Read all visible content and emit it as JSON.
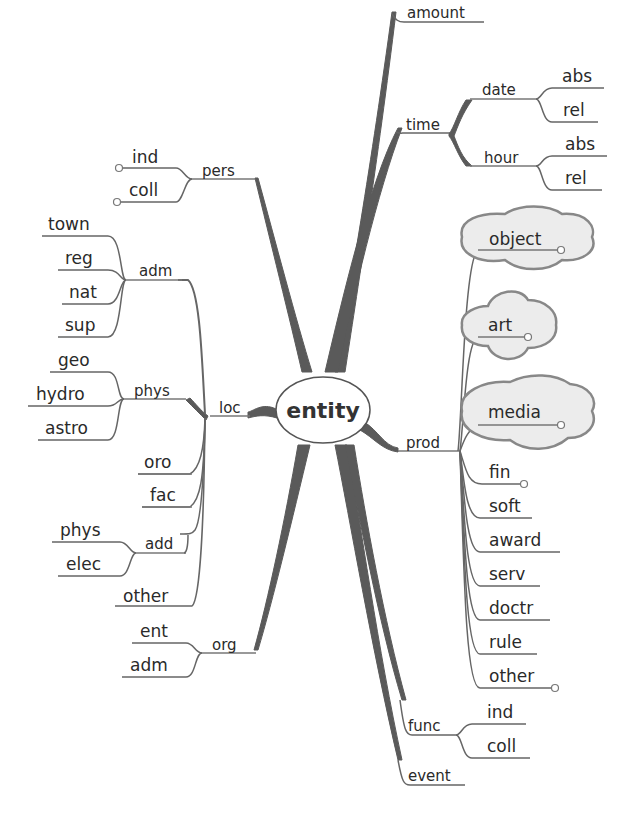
{
  "diagram": {
    "type": "mind-map",
    "root": "entity",
    "left": {
      "pers": {
        "label": "pers",
        "children": [
          "ind",
          "coll"
        ]
      },
      "loc": {
        "label": "loc",
        "adm": {
          "label": "adm",
          "children": [
            "town",
            "reg",
            "nat",
            "sup"
          ]
        },
        "phys": {
          "label": "phys",
          "children": [
            "geo",
            "hydro",
            "astro"
          ]
        },
        "oro": "oro",
        "fac": "fac",
        "add": {
          "label": "add",
          "children": [
            "phys",
            "elec"
          ]
        },
        "other": "other"
      },
      "org": {
        "label": "org",
        "children": [
          "ent",
          "adm"
        ]
      }
    },
    "right": {
      "amount": "amount",
      "time": {
        "label": "time",
        "date": {
          "label": "date",
          "children": [
            "abs",
            "rel"
          ]
        },
        "hour": {
          "label": "hour",
          "children": [
            "abs",
            "rel"
          ]
        }
      },
      "prod": {
        "label": "prod",
        "children": [
          "object",
          "art",
          "media",
          "fin",
          "soft",
          "award",
          "serv",
          "doctr",
          "rule",
          "other"
        ]
      },
      "func": {
        "label": "func",
        "children": [
          "ind",
          "coll"
        ]
      },
      "event": "event"
    }
  }
}
